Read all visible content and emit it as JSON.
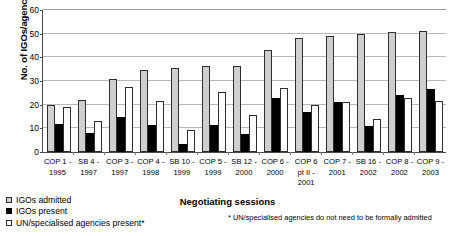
{
  "chart_data": {
    "type": "bar",
    "title": "",
    "xlabel": "Negotiating sessions",
    "ylabel": "No. of IGOs/agencies",
    "ylim": [
      0,
      60
    ],
    "yticks": [
      0,
      10,
      20,
      30,
      40,
      50,
      60
    ],
    "grid": true,
    "legend_position": "below-left",
    "categories": [
      "COP 1 -\n1995",
      "SB 4 -\n1997",
      "COP 3 -\n1997",
      "COP 4 -\n1998",
      "SB 10 -\n1999",
      "COP 5 -\n1999",
      "SB 12 -\n2000",
      "COP 6 -\n2000",
      "COP 6\npt II -\n2001",
      "COP 7 -\n2001",
      "SB 16 -\n2002",
      "COP 8 -\n2002",
      "COP 9 -\n2003"
    ],
    "series": [
      {
        "name": "IGOs admitted",
        "color": "#cfcfcf",
        "values": [
          20,
          22,
          31,
          34.5,
          35.5,
          36.5,
          36.5,
          43,
          48,
          49,
          50,
          50.5,
          51
        ]
      },
      {
        "name": "IGOs present",
        "color": "#000000",
        "values": [
          12,
          8,
          15,
          11.5,
          3.5,
          11.5,
          7.5,
          23,
          17,
          21,
          11,
          24,
          26.5
        ]
      },
      {
        "name": "UN/specialised agencies present*",
        "color": "#ffffff",
        "values": [
          19,
          13,
          27.5,
          21.5,
          9.5,
          25.5,
          15.5,
          27,
          20,
          21,
          14,
          23,
          21.5
        ]
      }
    ],
    "footnote": "* UN/specialised agencies do not need to be formally admitted"
  },
  "legend": {
    "items": [
      {
        "label": "IGOs admitted",
        "swatch": "light-gray-square"
      },
      {
        "label": "IGOs present",
        "swatch": "black-square"
      },
      {
        "label": "UN/specialised agencies present*",
        "swatch": "white-square"
      }
    ]
  }
}
